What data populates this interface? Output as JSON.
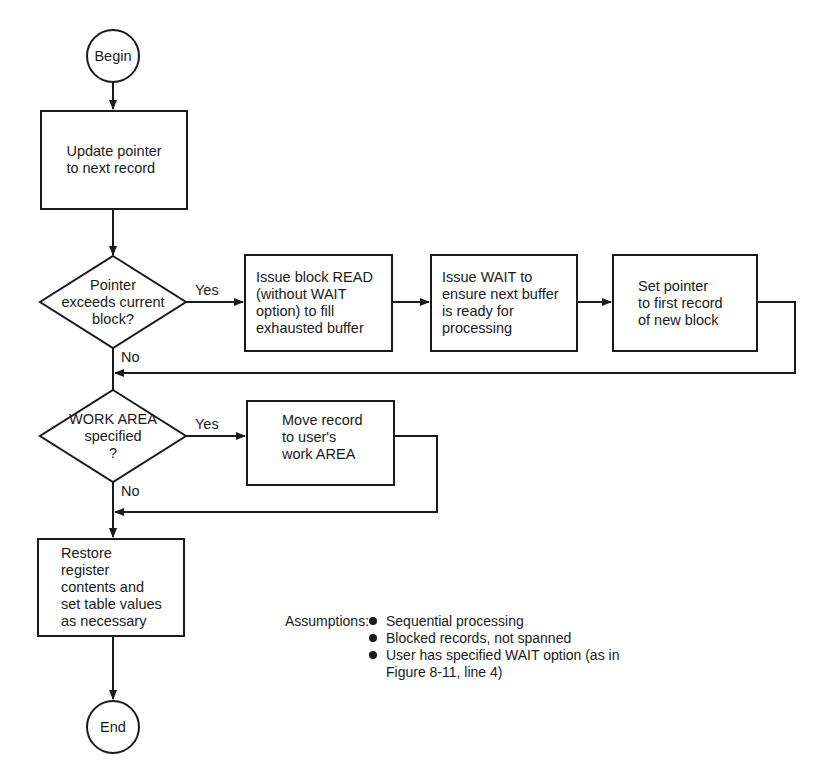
{
  "diagram": {
    "type": "flowchart",
    "nodes": {
      "begin": {
        "shape": "terminal-circle",
        "label": "Begin"
      },
      "update_pointer": {
        "shape": "process",
        "label": "Update pointer\nto next record"
      },
      "decision_exceeds": {
        "shape": "decision",
        "label": "Pointer\nexceeds current\nblock?"
      },
      "issue_read": {
        "shape": "process",
        "label": "Issue block READ\n(without WAIT\noption) to fill\nexhausted buffer"
      },
      "issue_wait": {
        "shape": "process",
        "label": "Issue WAIT to\nensure next buffer\nis ready for\nprocessing"
      },
      "set_pointer": {
        "shape": "process",
        "label": "Set pointer\nto first record\nof new block"
      },
      "decision_work_area": {
        "shape": "decision",
        "label": "WORK AREA\nspecified\n?"
      },
      "move_record": {
        "shape": "process",
        "label": "Move record\nto user's\nwork AREA"
      },
      "restore": {
        "shape": "process",
        "label": "Restore\nregister\ncontents and\nset table values\nas necessary"
      },
      "end": {
        "shape": "terminal-circle",
        "label": "End"
      }
    },
    "edge_labels": {
      "exceeds_yes": "Yes",
      "exceeds_no": "No",
      "work_area_yes": "Yes",
      "work_area_no": "No"
    },
    "edges": [
      {
        "from": "begin",
        "to": "update_pointer"
      },
      {
        "from": "update_pointer",
        "to": "decision_exceeds"
      },
      {
        "from": "decision_exceeds",
        "to": "issue_read",
        "label": "Yes"
      },
      {
        "from": "issue_read",
        "to": "issue_wait"
      },
      {
        "from": "issue_wait",
        "to": "set_pointer"
      },
      {
        "from": "set_pointer",
        "to": "decision_work_area"
      },
      {
        "from": "decision_exceeds",
        "to": "decision_work_area",
        "label": "No"
      },
      {
        "from": "decision_work_area",
        "to": "move_record",
        "label": "Yes"
      },
      {
        "from": "move_record",
        "to": "restore"
      },
      {
        "from": "decision_work_area",
        "to": "restore",
        "label": "No"
      },
      {
        "from": "restore",
        "to": "end"
      }
    ],
    "assumptions": {
      "heading": "Assumptions:",
      "items": [
        "Sequential processing",
        "Blocked records, not spanned",
        "User has specified WAIT option (as in Figure 8-11, line 4)"
      ]
    },
    "colors": {
      "ink": "#1a1a1a",
      "background": "#ffffff"
    }
  }
}
